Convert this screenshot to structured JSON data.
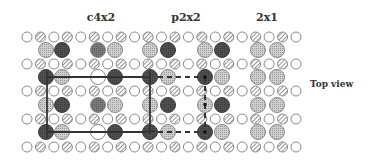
{
  "titles": {
    "c4x2": "c4x2",
    "p2x2": "p2x2",
    "2x1": "2x1"
  },
  "side_label": "Top view",
  "colors": {
    "outline": "#8a8a8a",
    "open_fill": "#ffffff",
    "hatch_light": "#d9d9d9",
    "hatch_line": "#8a8a8a",
    "light_fill": "#c8c8c8",
    "dark_fill": "#4a4a4a",
    "dark_medium_fill": "#6e6e6e",
    "line": "#333333"
  },
  "geometry": {
    "small_r": 5,
    "large_r": 7.5,
    "small_x0": 27,
    "small_dx": 13.45,
    "small_count": 21,
    "small_rows_y": [
      37,
      64,
      91,
      119,
      147
    ],
    "large_rows_y": [
      50,
      77,
      105,
      132
    ],
    "large_x": [
      46,
      62,
      98,
      115,
      150,
      168,
      205,
      222,
      258,
      277
    ]
  },
  "small_pattern": [
    "open",
    "hatched"
  ],
  "large_rows": [
    [
      "light",
      "dark",
      "dark-medium",
      "light",
      "light",
      "dark",
      "light",
      "dark",
      "light",
      "light"
    ],
    [
      "dark",
      "light",
      "open",
      "dark",
      "dark",
      "light",
      "dark",
      "light",
      "light",
      "light"
    ],
    [
      "light",
      "dark",
      "dark-medium",
      "light",
      "light",
      "dark",
      "light",
      "dark",
      "light",
      "light"
    ],
    [
      "dark",
      "light",
      "open",
      "dark",
      "dark",
      "light",
      "dark",
      "light",
      "light",
      "light"
    ]
  ],
  "cells": {
    "c4x2": {
      "type": "solid",
      "x1": 47,
      "y1": 77,
      "x2": 150,
      "y2": 132
    },
    "p2x2": {
      "type": "dashed",
      "x1": 150,
      "y1": 77,
      "x2": 205,
      "y2": 132
    }
  }
}
